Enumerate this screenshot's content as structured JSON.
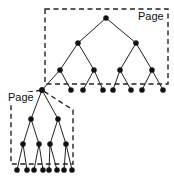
{
  "figure": {
    "width": 174,
    "height": 185,
    "background_color": "#ffffff",
    "ink_color": "#111111",
    "line_color": "#222222"
  },
  "pages": [
    {
      "id": "page-upper",
      "label": "Page",
      "label_x": 138,
      "label_y": 20,
      "shape": "rect",
      "x": 45,
      "y": 9,
      "width": 123,
      "height": 75,
      "points": ""
    },
    {
      "id": "page-lower",
      "label": "Page",
      "label_x": 8,
      "label_y": 101,
      "shape": "polygon",
      "x": 11,
      "y": 92,
      "width": 62,
      "height": 72,
      "points": "11,95 42,90 73,110 73,164 11,164"
    }
  ],
  "nodes": {
    "upper": {
      "root": [
        {
          "id": "u0",
          "x": 106,
          "y": 18
        }
      ],
      "level1": [
        {
          "id": "u1",
          "x": 78,
          "y": 43
        },
        {
          "id": "u2",
          "x": 136,
          "y": 43
        }
      ],
      "level2": [
        {
          "id": "u3",
          "x": 60,
          "y": 70
        },
        {
          "id": "u4",
          "x": 94,
          "y": 70
        },
        {
          "id": "u5",
          "x": 120,
          "y": 70
        },
        {
          "id": "u6",
          "x": 152,
          "y": 70
        }
      ],
      "leaves": [
        {
          "id": "u7",
          "x": 42,
          "y": 90
        },
        {
          "id": "u8",
          "x": 71,
          "y": 90
        },
        {
          "id": "u9",
          "x": 83,
          "y": 90
        },
        {
          "id": "u10",
          "x": 103,
          "y": 90
        },
        {
          "id": "u11",
          "x": 113,
          "y": 90
        },
        {
          "id": "u12",
          "x": 131,
          "y": 90
        },
        {
          "id": "u13",
          "x": 142,
          "y": 90
        },
        {
          "id": "u14",
          "x": 163,
          "y": 90
        }
      ]
    },
    "lower": {
      "root": [
        {
          "id": "l0",
          "x": 42,
          "y": 90
        }
      ],
      "level1": [
        {
          "id": "l1",
          "x": 31,
          "y": 119
        },
        {
          "id": "l2",
          "x": 58,
          "y": 119
        }
      ],
      "level2": [
        {
          "id": "l3",
          "x": 23,
          "y": 144
        },
        {
          "id": "l4",
          "x": 39,
          "y": 144
        },
        {
          "id": "l5",
          "x": 50,
          "y": 144
        },
        {
          "id": "l6",
          "x": 66,
          "y": 144
        }
      ],
      "leaves": [
        {
          "id": "l7",
          "x": 17,
          "y": 170
        },
        {
          "id": "l8",
          "x": 27,
          "y": 170
        },
        {
          "id": "l9",
          "x": 34,
          "y": 170
        },
        {
          "id": "l10",
          "x": 43,
          "y": 170
        },
        {
          "id": "l11",
          "x": 49,
          "y": 170
        },
        {
          "id": "l12",
          "x": 57,
          "y": 170
        },
        {
          "id": "l13",
          "x": 64,
          "y": 170
        },
        {
          "id": "l14",
          "x": 72,
          "y": 170
        }
      ]
    }
  },
  "edges": {
    "upper": [
      {
        "from": "u0",
        "to": "u1"
      },
      {
        "from": "u0",
        "to": "u2"
      },
      {
        "from": "u1",
        "to": "u3"
      },
      {
        "from": "u1",
        "to": "u4"
      },
      {
        "from": "u2",
        "to": "u5"
      },
      {
        "from": "u2",
        "to": "u6"
      },
      {
        "from": "u3",
        "to": "u7"
      },
      {
        "from": "u3",
        "to": "u8"
      },
      {
        "from": "u4",
        "to": "u9"
      },
      {
        "from": "u4",
        "to": "u10"
      },
      {
        "from": "u5",
        "to": "u11"
      },
      {
        "from": "u5",
        "to": "u12"
      },
      {
        "from": "u6",
        "to": "u13"
      },
      {
        "from": "u6",
        "to": "u14"
      }
    ],
    "lower": [
      {
        "from": "l0",
        "to": "l1"
      },
      {
        "from": "l0",
        "to": "l2"
      },
      {
        "from": "l1",
        "to": "l3"
      },
      {
        "from": "l1",
        "to": "l4"
      },
      {
        "from": "l2",
        "to": "l5"
      },
      {
        "from": "l2",
        "to": "l6"
      },
      {
        "from": "l3",
        "to": "l7"
      },
      {
        "from": "l3",
        "to": "l8"
      },
      {
        "from": "l4",
        "to": "l9"
      },
      {
        "from": "l4",
        "to": "l10"
      },
      {
        "from": "l5",
        "to": "l11"
      },
      {
        "from": "l5",
        "to": "l12"
      },
      {
        "from": "l6",
        "to": "l13"
      },
      {
        "from": "l6",
        "to": "l14"
      }
    ]
  },
  "node_radius": 2.6
}
